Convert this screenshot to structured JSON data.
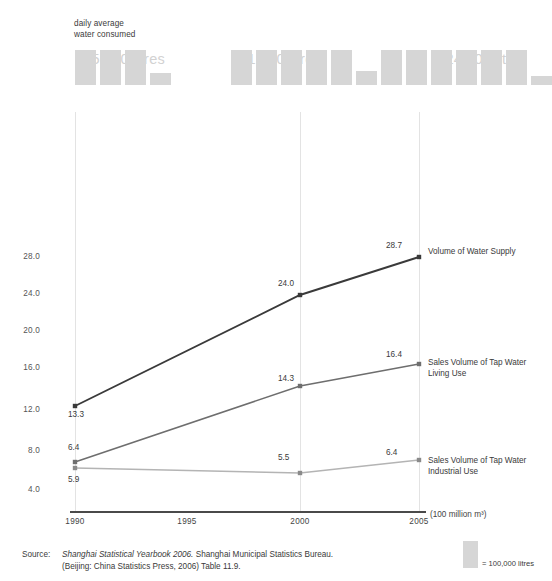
{
  "pictogram": {
    "caption_line1": "daily average",
    "caption_line2": "water consumed",
    "groups": [
      {
        "year": "1990",
        "label": "335,600 litres",
        "full_bars": 3,
        "partial_bar_fraction": 0.356,
        "value_litres": 335600
      },
      {
        "year": "2000",
        "label": "541,200 litres",
        "full_bars": 5,
        "partial_bar_fraction": 0.412,
        "value_litres": 541200
      },
      {
        "year": "2005",
        "label": "624,800 litres",
        "full_bars": 6,
        "partial_bar_fraction": 0.248,
        "value_litres": 624800
      }
    ],
    "key_swatch_label": "= 100,000 litres",
    "bar_unit_litres": 100000
  },
  "chart_data": {
    "type": "line",
    "title": "",
    "xlabel": "",
    "ylabel": "(100 million m³)",
    "x": [
      1990,
      1995,
      2000,
      2005
    ],
    "xtick_labels": [
      "1990",
      "1995",
      "2000",
      "2005"
    ],
    "ytick_labels": [
      "4.0",
      "8.0",
      "12.0",
      "16.0",
      "20.0",
      "24.0",
      "28.0"
    ],
    "ylim": [
      2.0,
      30.0
    ],
    "grid": "vertical",
    "legend_position": "right-inline",
    "series": [
      {
        "name": "Volume of Water Supply",
        "color": "#3a3a3a",
        "x": [
          1990,
          2000,
          2005
        ],
        "values": [
          13.3,
          24.0,
          28.7
        ],
        "point_labels": [
          "13.3",
          "24.0",
          "28.7"
        ]
      },
      {
        "name": "Sales Volume of Tap Water Living Use",
        "color": "#6e6e6e",
        "x": [
          1990,
          2000,
          2005
        ],
        "values": [
          6.4,
          14.3,
          16.4
        ],
        "point_labels": [
          "6.4",
          "14.3",
          "16.4"
        ]
      },
      {
        "name": "Sales Volume of Tap Water Industrial Use",
        "color": "#b4b4b4",
        "x": [
          1990,
          2000,
          2005
        ],
        "values": [
          5.9,
          5.5,
          6.4
        ],
        "point_labels": [
          "5.9",
          "5.5",
          "6.4"
        ]
      }
    ],
    "series_labels": [
      {
        "line1": "Volume of Water Supply",
        "line2": ""
      },
      {
        "line1": "Sales Volume of Tap Water",
        "line2": "Living Use"
      },
      {
        "line1": "Sales Volume of Tap Water",
        "line2": "Industrial Use"
      }
    ]
  },
  "footer": {
    "source_label": "Source:",
    "source_italic": "Shanghai Statistical Yearbook 2006.",
    "source_rest": " Shanghai Municipal Statistics Bureau.",
    "source_line2": "(Beijing: China Statistics Press, 2006) Table 11.9."
  },
  "colors": {
    "bar_grey": "#d6d6d6",
    "title_grey": "#d2d2d2",
    "gridline": "#e3e3e3",
    "axis": "#4a4a4a",
    "series_dark": "#3a3a3a",
    "series_mid": "#6e6e6e",
    "series_light": "#b4b4b4"
  }
}
